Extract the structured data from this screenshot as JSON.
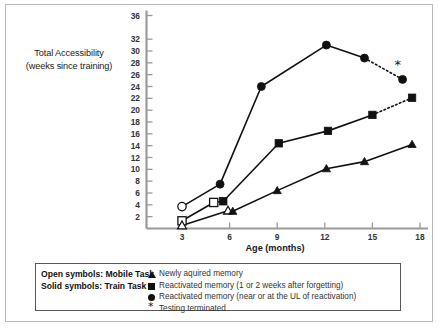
{
  "figure": {
    "frame_color": "#b9b9b9",
    "axis_color": "#9a9a9a",
    "series_color": "#111111"
  },
  "axes": {
    "y_title_line1": "Total Accessibility",
    "y_title_line2": "(weeks since training)",
    "x_title": "Age (months)",
    "y_ticks": [
      36,
      32,
      30,
      28,
      26,
      24,
      22,
      20,
      18,
      16,
      14,
      12,
      10,
      8,
      6,
      4,
      2
    ],
    "x_ticks": [
      3,
      6,
      9,
      12,
      15,
      18
    ]
  },
  "legend": {
    "left_lines": [
      "Open symbols: Mobile Task",
      "Solid symbols: Train Task"
    ],
    "entries": [
      {
        "symbol": "triangle-up",
        "label": "Newly aquired memory"
      },
      {
        "symbol": "square",
        "label": "Reactivated memory (1 or 2 weeks after forgetting)"
      },
      {
        "symbol": "circle",
        "label": "Reactivated memory (near or at the UL of reactivation)"
      },
      {
        "symbol": "asterisk",
        "label": "Testing terminated"
      }
    ]
  },
  "chart_data": {
    "type": "line",
    "title": "",
    "xlabel": "Age (months)",
    "ylabel": "Total Accessibility (weeks since training)",
    "xlim": [
      2.2,
      18.4
    ],
    "ylim": [
      0,
      37
    ],
    "grid": false,
    "legend_position": "below-plot",
    "series": [
      {
        "name": "Reactivated memory (near or at the UL of reactivation)",
        "symbol": "circle",
        "points": [
          {
            "x": 3.0,
            "y": 3.7,
            "fill": "open"
          },
          {
            "x": 5.4,
            "y": 7.5,
            "fill": "solid"
          },
          {
            "x": 8.0,
            "y": 24.0,
            "fill": "solid"
          },
          {
            "x": 12.1,
            "y": 31.0,
            "fill": "solid"
          },
          {
            "x": 14.5,
            "y": 28.8,
            "fill": "solid"
          },
          {
            "x": 16.9,
            "y": 25.2,
            "fill": "solid"
          }
        ],
        "dashed_from_index": 4
      },
      {
        "name": "Reactivated memory (1 or 2 weeks after forgetting)",
        "symbol": "square",
        "points": [
          {
            "x": 3.0,
            "y": 1.3,
            "fill": "open"
          },
          {
            "x": 5.0,
            "y": 4.4,
            "fill": "open"
          },
          {
            "x": 5.6,
            "y": 4.6,
            "fill": "solid"
          },
          {
            "x": 9.1,
            "y": 14.4,
            "fill": "solid"
          },
          {
            "x": 12.2,
            "y": 16.5,
            "fill": "solid"
          },
          {
            "x": 15.0,
            "y": 19.2,
            "fill": "solid"
          },
          {
            "x": 17.5,
            "y": 22.1,
            "fill": "solid"
          }
        ],
        "dashed_from_index": 5
      },
      {
        "name": "Newly aquired memory",
        "symbol": "triangle-up",
        "points": [
          {
            "x": 3.0,
            "y": 0.5,
            "fill": "open"
          },
          {
            "x": 5.9,
            "y": 3.0,
            "fill": "open"
          },
          {
            "x": 6.2,
            "y": 2.9,
            "fill": "solid"
          },
          {
            "x": 9.0,
            "y": 6.4,
            "fill": "solid"
          },
          {
            "x": 12.1,
            "y": 10.1,
            "fill": "solid"
          },
          {
            "x": 14.5,
            "y": 11.3,
            "fill": "solid"
          },
          {
            "x": 17.5,
            "y": 14.2,
            "fill": "solid"
          }
        ],
        "dashed_from_index": -1
      }
    ],
    "annotations": [
      {
        "text": "*",
        "x": 16.6,
        "y": 27.0,
        "name": "testing-terminated-marker"
      }
    ]
  }
}
